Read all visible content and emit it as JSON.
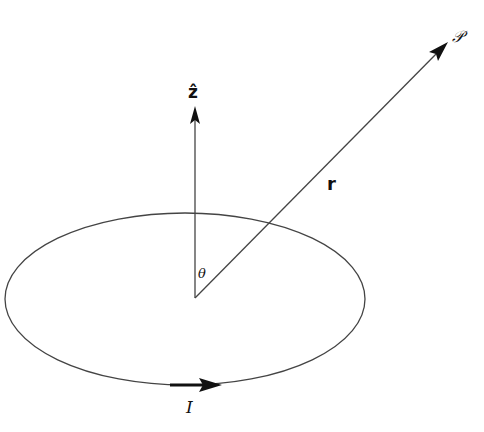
{
  "diagram": {
    "labels": {
      "z_axis": "ẑ",
      "radius": "r",
      "field_point": "𝒫",
      "angle": "θ",
      "current": "I"
    },
    "elements": [
      {
        "id": "current-loop",
        "kind": "ellipse",
        "role": "wire loop carrying current"
      },
      {
        "id": "z-axis",
        "kind": "arrow",
        "role": "unit vector z-hat"
      },
      {
        "id": "radius-vector",
        "kind": "arrow",
        "role": "position vector r to field point P"
      },
      {
        "id": "current-arrow",
        "kind": "arrow",
        "role": "direction of current I"
      }
    ],
    "colors": {
      "line": "#444444",
      "text": "#111111",
      "background": "#ffffff"
    }
  }
}
